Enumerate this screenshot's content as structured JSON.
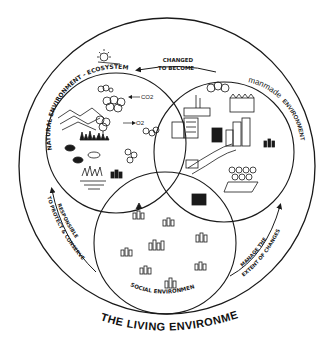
{
  "title": "THE LIVING ENVIRONMENT",
  "circles": {
    "natural": {
      "label": "NATURAL ENVIRONMENT - ECOSYSTEM"
    },
    "manmade": {
      "label_script": "manmade",
      "label_caps": "ENVIRONMENT"
    },
    "social": {
      "label": "SOCIAL ENVIRONMENT"
    }
  },
  "arrows": {
    "top": {
      "line1": "CHANGED",
      "line2": "TO BECOME"
    },
    "left": {
      "line1": "RESPONSIBLE",
      "line2": "TO PROTECT & CONSERVE"
    },
    "right": {
      "line1": "MANAGE THE",
      "line2": "EXTENT OF CHANGES"
    }
  },
  "gases": {
    "co2": "CO2",
    "o2": "O2"
  },
  "colors": {
    "ink": "#1a1a1a",
    "background": "#ffffff"
  }
}
